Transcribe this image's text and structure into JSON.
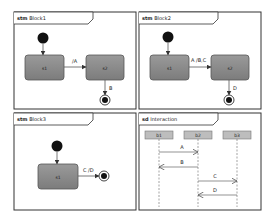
{
  "diagrams": {
    "block1": {
      "keyword": "stm",
      "name": "Block1",
      "states": [
        {
          "label": "s1"
        },
        {
          "label": "s2"
        }
      ],
      "transitions": [
        {
          "label": "/A"
        },
        {
          "label": "B"
        }
      ]
    },
    "block2": {
      "keyword": "stm",
      "name": "Block2",
      "states": [
        {
          "label": "s1"
        },
        {
          "label": "s2"
        }
      ],
      "transitions": [
        {
          "label": "A /B,C"
        },
        {
          "label": "D"
        }
      ]
    },
    "block3": {
      "keyword": "stm",
      "name": "Block3",
      "states": [
        {
          "label": "s1"
        }
      ],
      "transitions": [
        {
          "label": "C /D"
        }
      ]
    },
    "interaction": {
      "keyword": "sd",
      "name": "Interaction",
      "lifelines": [
        {
          "label": "b1"
        },
        {
          "label": "b2"
        },
        {
          "label": "b3"
        }
      ],
      "messages": [
        {
          "label": "A",
          "from": "b1",
          "to": "b2"
        },
        {
          "label": "B",
          "from": "b2",
          "to": "b1"
        },
        {
          "label": "C",
          "from": "b2",
          "to": "b3"
        },
        {
          "label": "D",
          "from": "b3",
          "to": "b2"
        }
      ]
    }
  }
}
